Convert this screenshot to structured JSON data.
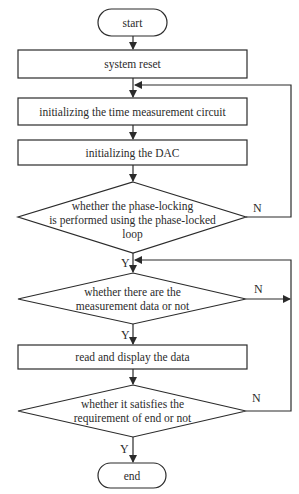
{
  "flowchart": {
    "start": {
      "label": "start"
    },
    "steps": [
      {
        "label": "system reset"
      },
      {
        "label": "initializing the time measurement circuit"
      },
      {
        "label": "initializing the DAC"
      }
    ],
    "decision_pll": {
      "lines": [
        "whether the phase-locking",
        "is performed using the phase-locked",
        "loop"
      ],
      "yes_label": "Y",
      "no_label": "N"
    },
    "decision_data": {
      "lines": [
        "whether there are the",
        "measurement data or not"
      ],
      "yes_label": "Y",
      "no_label": "N"
    },
    "read_step": {
      "label": "read and display the data"
    },
    "decision_end": {
      "lines": [
        "whether it satisfies the",
        "requirement of end or not"
      ],
      "yes_label": "Y",
      "no_label": "N"
    },
    "end": {
      "label": "end"
    }
  },
  "colors": {
    "stroke": "#2b2b2b",
    "background": "#ffffff"
  }
}
